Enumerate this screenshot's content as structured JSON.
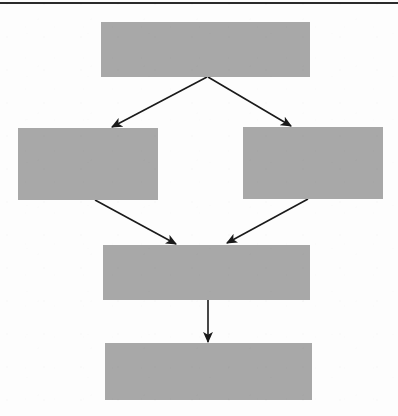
{
  "document": {
    "type": "flowchart",
    "title": "",
    "page_rule_color": "#2b2b2b",
    "background_color": "#fdfdfd"
  },
  "diagram": {
    "node_fill_color": "#a8a8a8",
    "edge_color": "#1a1a1a",
    "nodes": [
      {
        "id": "node-1",
        "label": "",
        "row": 1,
        "x": 101,
        "y": 22,
        "width": 209,
        "height": 55
      },
      {
        "id": "node-2",
        "label": "",
        "row": 2,
        "x": 18,
        "y": 128,
        "width": 140,
        "height": 72
      },
      {
        "id": "node-3",
        "label": "",
        "row": 2,
        "x": 243,
        "y": 127,
        "width": 140,
        "height": 72
      },
      {
        "id": "node-4",
        "label": "",
        "row": 3,
        "x": 103,
        "y": 245,
        "width": 207,
        "height": 55
      },
      {
        "id": "node-5",
        "label": "",
        "row": 4,
        "x": 105,
        "y": 343,
        "width": 207,
        "height": 57
      }
    ],
    "edges": [
      {
        "id": "edge-1-2",
        "from": "node-1",
        "to": "node-2",
        "label": "",
        "arrowhead": "filled-triangle",
        "x1": 207,
        "y1": 77,
        "x2": 112,
        "y2": 127
      },
      {
        "id": "edge-1-3",
        "from": "node-1",
        "to": "node-3",
        "label": "",
        "arrowhead": "filled-triangle",
        "x1": 208,
        "y1": 77,
        "x2": 291,
        "y2": 126
      },
      {
        "id": "edge-2-4",
        "from": "node-2",
        "to": "node-4",
        "label": "",
        "arrowhead": "filled-triangle",
        "x1": 95,
        "y1": 200,
        "x2": 176,
        "y2": 244
      },
      {
        "id": "edge-3-4",
        "from": "node-3",
        "to": "node-4",
        "label": "",
        "arrowhead": "filled-triangle",
        "x1": 308,
        "y1": 199,
        "x2": 227,
        "y2": 243
      },
      {
        "id": "edge-4-5",
        "from": "node-4",
        "to": "node-5",
        "label": "",
        "arrowhead": "filled-triangle",
        "x1": 208,
        "y1": 300,
        "x2": 208,
        "y2": 342
      }
    ]
  }
}
